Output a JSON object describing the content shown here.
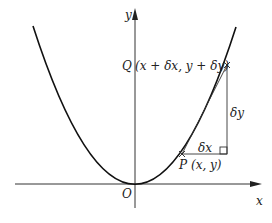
{
  "diagram": {
    "axes": {
      "x_label": "x",
      "y_label": "y",
      "origin_label": "O"
    },
    "points": {
      "P": {
        "name": "P",
        "coords": "(x, y)"
      },
      "Q": {
        "name": "Q",
        "coords": "(x + δx, y + δy)"
      }
    },
    "increments": {
      "dx": "δx",
      "dy": "δy"
    },
    "colors": {
      "ink": "#222222",
      "background": "#ffffff"
    }
  }
}
